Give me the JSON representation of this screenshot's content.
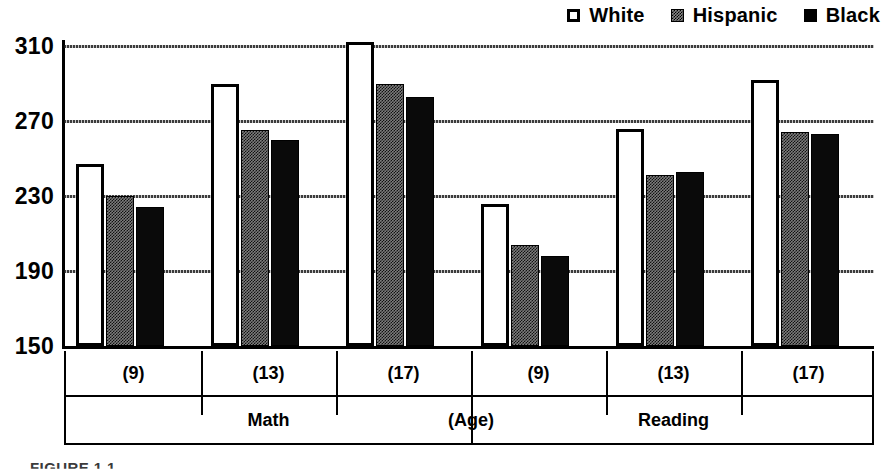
{
  "legend": {
    "items": [
      {
        "label": "White",
        "icon": "square-outline-icon",
        "swatch": "white"
      },
      {
        "label": "Hispanic",
        "icon": "square-hatched-icon",
        "swatch": "hispanic"
      },
      {
        "label": "Black",
        "icon": "square-filled-icon",
        "swatch": "black"
      }
    ]
  },
  "axis": {
    "y_ticks": [
      "310",
      "270",
      "230",
      "190",
      "150"
    ],
    "group_labels": [
      "(9)",
      "(13)",
      "(17)",
      "(9)",
      "(13)",
      "(17)"
    ],
    "section_labels": [
      "Math",
      "(Age)",
      "Reading"
    ]
  },
  "caption": "FIGURE 1.1",
  "chart_data": {
    "type": "bar",
    "title": "",
    "xlabel": "(Age)",
    "ylabel": "",
    "ylim": [
      150,
      310
    ],
    "yticks": [
      150,
      190,
      230,
      270,
      310
    ],
    "grid": true,
    "legend_position": "top-right",
    "categories": [
      "Math (9)",
      "Math (13)",
      "Math (17)",
      "Reading (9)",
      "Reading (13)",
      "Reading (17)"
    ],
    "group_labels": [
      "(9)",
      "(13)",
      "(17)",
      "(9)",
      "(13)",
      "(17)"
    ],
    "section_labels": [
      "Math",
      "Reading"
    ],
    "series": [
      {
        "name": "White",
        "values": [
          247,
          290,
          312,
          226,
          266,
          292
        ]
      },
      {
        "name": "Hispanic",
        "values": [
          230,
          265,
          290,
          204,
          241,
          264
        ]
      },
      {
        "name": "Black",
        "values": [
          224,
          260,
          283,
          198,
          243,
          263
        ]
      }
    ]
  }
}
